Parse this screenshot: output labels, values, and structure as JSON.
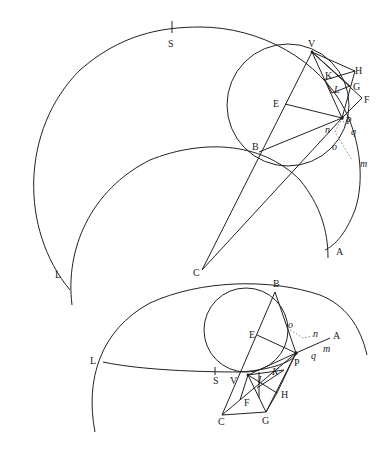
{
  "figures": [
    {
      "id": "upper-figure",
      "labels": {
        "S": "S",
        "V": "V",
        "H": "H",
        "K": "K",
        "G": "G",
        "L_small": "L",
        "F": "F",
        "E": "E",
        "P": "P",
        "n": "n",
        "q": "q",
        "o": "o",
        "B": "B",
        "m": "m",
        "L": "L",
        "C": "C",
        "A": "A"
      }
    },
    {
      "id": "lower-figure",
      "labels": {
        "B": "B",
        "E": "E",
        "o": "o",
        "n": "n",
        "A": "A",
        "L": "L",
        "P": "P",
        "m": "m",
        "q": "q",
        "S": "S",
        "V": "V",
        "I": "I",
        "K": "K",
        "F": "F",
        "H": "H",
        "C": "C",
        "G": "G"
      }
    }
  ],
  "colors": {
    "stroke": "#222222",
    "dotted": "#888888",
    "background": "#ffffff"
  }
}
